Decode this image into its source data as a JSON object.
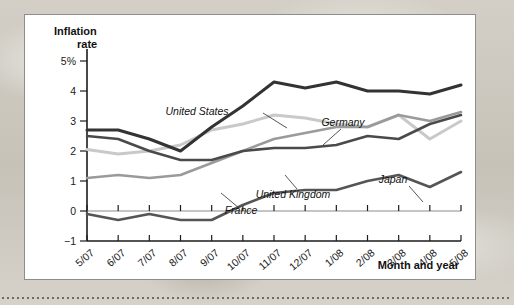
{
  "figure": {
    "panel_background": "#ffffff",
    "panel_border": "#8d8d8d"
  },
  "chart_data": {
    "type": "line",
    "title": "",
    "ylabel": "Inflation rate",
    "xlabel": "Month and year",
    "ylim": [
      -1,
      5.4
    ],
    "yticks": [
      -1,
      0,
      1,
      2,
      3,
      4,
      5
    ],
    "ytick_labels": [
      "−1",
      "0",
      "1",
      "2",
      "3",
      "4",
      "5%"
    ],
    "grid": false,
    "legend_position": "inline-labels",
    "categories": [
      "5/07",
      "6/07",
      "7/07",
      "8/07",
      "9/07",
      "10/07",
      "11/07",
      "12/07",
      "1/08",
      "2/08",
      "3/08",
      "4/08",
      "5/08"
    ],
    "series": [
      {
        "name": "United States",
        "color": "#333333",
        "width": 3.0,
        "values": [
          2.7,
          2.7,
          2.4,
          2.0,
          2.8,
          3.5,
          4.3,
          4.1,
          4.3,
          4.0,
          4.0,
          3.9,
          4.2
        ]
      },
      {
        "name": "Germany",
        "color": "#c9c9c9",
        "width": 3.0,
        "values": [
          2.05,
          1.9,
          2.0,
          2.2,
          2.7,
          2.9,
          3.2,
          3.1,
          2.9,
          2.8,
          3.2,
          2.4,
          3.0
        ]
      },
      {
        "name": "United Kingdom",
        "color": "#4a4a4a",
        "width": 2.6,
        "values": [
          2.5,
          2.4,
          2.0,
          1.7,
          1.7,
          2.0,
          2.1,
          2.1,
          2.2,
          2.5,
          2.4,
          2.9,
          3.2
        ]
      },
      {
        "name": "France",
        "color": "#9a9a9a",
        "width": 2.6,
        "values": [
          1.1,
          1.2,
          1.1,
          1.2,
          1.6,
          2.0,
          2.4,
          2.6,
          2.8,
          2.8,
          3.2,
          3.0,
          3.3
        ]
      },
      {
        "name": "Japan",
        "color": "#555555",
        "width": 2.6,
        "values": [
          -0.1,
          -0.3,
          -0.1,
          -0.3,
          -0.3,
          0.2,
          0.6,
          0.7,
          0.7,
          1.0,
          1.2,
          0.8,
          1.3
        ]
      }
    ],
    "annotations": [
      {
        "text": "United States",
        "series": "United States",
        "label_x": 172,
        "label_y": 100,
        "leader": "M 238 98 L 262 113"
      },
      {
        "text": "Germany",
        "series": "Germany",
        "label_x": 318,
        "label_y": 111,
        "leader": "M 316 114 L 298 130"
      },
      {
        "text": "United Kingdom",
        "series": "United Kingdom",
        "label_x": 268,
        "label_y": 183,
        "leader": "M 272 174 L 260 160"
      },
      {
        "text": "France",
        "series": "France",
        "label_x": 216,
        "label_y": 199,
        "leader": "M 214 193 L 196 178"
      },
      {
        "text": "Japan",
        "series": "Japan",
        "label_x": 368,
        "label_y": 168,
        "leader": "M 384 171 L 398 187"
      }
    ]
  },
  "labels": {
    "y_axis_title_line1": "Inflation",
    "y_axis_title_line2": "rate",
    "x_axis_title": "Month and year"
  }
}
